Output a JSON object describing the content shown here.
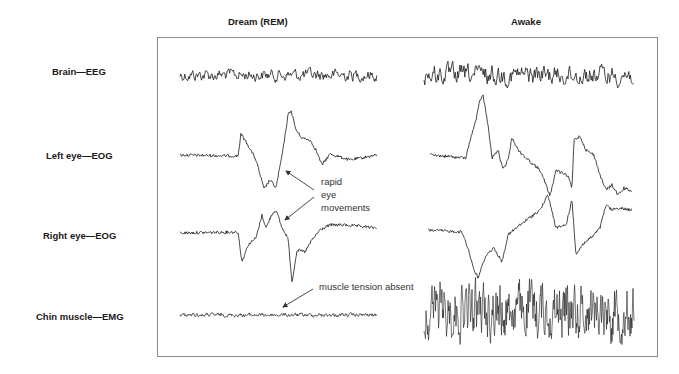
{
  "columns": [
    {
      "title": "Dream (REM)",
      "x_center": 266
    },
    {
      "title": "Awake",
      "x_center": 528
    }
  ],
  "rows": [
    {
      "label": "Brain—EEG",
      "y": 77
    },
    {
      "label": "Left eye—EOG",
      "y": 157
    },
    {
      "label": "Right eye—EOG",
      "y": 237
    },
    {
      "label": "Chin muscle—EMG",
      "y": 318
    }
  ],
  "annotations": {
    "rapid_eye_movements": [
      "rapid",
      "eye",
      "movements"
    ],
    "muscle_tension": "muscle tension absent"
  },
  "colors": {
    "trace": "#1a1a1a",
    "frame": "#8a8a8a",
    "arrow": "#333333"
  },
  "traces": {
    "dream": {
      "x_start": 180,
      "x_end": 377,
      "eeg": {
        "baseline": 75,
        "amp": 5,
        "noise": "medium"
      },
      "left_eog": {
        "points": [
          [
            180,
            155
          ],
          [
            238,
            156
          ],
          [
            241,
            134
          ],
          [
            248,
            145
          ],
          [
            256,
            160
          ],
          [
            264,
            189
          ],
          [
            270,
            180
          ],
          [
            276,
            188
          ],
          [
            283,
            150
          ],
          [
            288,
            115
          ],
          [
            291,
            110
          ],
          [
            296,
            130
          ],
          [
            302,
            138
          ],
          [
            310,
            140
          ],
          [
            316,
            150
          ],
          [
            322,
            165
          ],
          [
            330,
            154
          ],
          [
            350,
            160
          ],
          [
            377,
            155
          ]
        ]
      },
      "right_eog": {
        "points": [
          [
            180,
            233
          ],
          [
            238,
            232
          ],
          [
            242,
            262
          ],
          [
            248,
            245
          ],
          [
            256,
            238
          ],
          [
            262,
            215
          ],
          [
            266,
            228
          ],
          [
            272,
            214
          ],
          [
            276,
            210
          ],
          [
            282,
            228
          ],
          [
            288,
            238
          ],
          [
            292,
            282
          ],
          [
            297,
            250
          ],
          [
            305,
            252
          ],
          [
            312,
            240
          ],
          [
            320,
            230
          ],
          [
            330,
            225
          ],
          [
            345,
            225
          ],
          [
            377,
            228
          ]
        ]
      },
      "emg": {
        "baseline": 315,
        "amp": 1.5
      }
    },
    "awake": {
      "x_start": 424,
      "x_end": 634,
      "eeg": {
        "baseline": 75,
        "amp": 8,
        "noise": "high"
      },
      "left_eog": {
        "points": [
          [
            430,
            155
          ],
          [
            466,
            158
          ],
          [
            470,
            140
          ],
          [
            476,
            120
          ],
          [
            480,
            100
          ],
          [
            483,
            95
          ],
          [
            488,
            125
          ],
          [
            492,
            158
          ],
          [
            498,
            150
          ],
          [
            503,
            170
          ],
          [
            508,
            160
          ],
          [
            512,
            137
          ],
          [
            518,
            150
          ],
          [
            526,
            158
          ],
          [
            540,
            170
          ],
          [
            546,
            185
          ],
          [
            550,
            196
          ],
          [
            556,
            170
          ],
          [
            568,
            176
          ],
          [
            572,
            188
          ],
          [
            574,
            140
          ],
          [
            580,
            136
          ],
          [
            586,
            150
          ],
          [
            594,
            155
          ],
          [
            600,
            175
          ],
          [
            606,
            190
          ],
          [
            612,
            185
          ],
          [
            618,
            195
          ],
          [
            624,
            188
          ],
          [
            632,
            192
          ]
        ]
      },
      "right_eog": {
        "points": [
          [
            428,
            230
          ],
          [
            462,
            232
          ],
          [
            468,
            248
          ],
          [
            474,
            270
          ],
          [
            478,
            278
          ],
          [
            486,
            255
          ],
          [
            494,
            248
          ],
          [
            502,
            262
          ],
          [
            508,
            235
          ],
          [
            520,
            225
          ],
          [
            540,
            210
          ],
          [
            548,
            195
          ],
          [
            556,
            228
          ],
          [
            566,
            225
          ],
          [
            572,
            200
          ],
          [
            576,
            255
          ],
          [
            582,
            245
          ],
          [
            594,
            235
          ],
          [
            600,
            228
          ],
          [
            606,
            205
          ],
          [
            612,
            210
          ],
          [
            618,
            208
          ],
          [
            632,
            210
          ]
        ]
      },
      "emg": {
        "baseline": 310,
        "amp": 22
      }
    }
  }
}
